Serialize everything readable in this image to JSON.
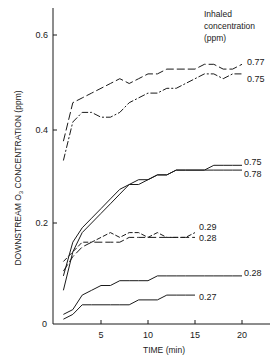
{
  "chart_data": {
    "type": "line",
    "title": "",
    "xlabel": "TIME (min)",
    "ylabel": "DOWNSTREAM O3 CONCENTRATION (ppm)",
    "xlim": [
      0,
      22
    ],
    "ylim": [
      0,
      0.65
    ],
    "x_ticks": [
      5,
      10,
      15,
      20
    ],
    "y_ticks": [
      0,
      0.2,
      0.4,
      0.6
    ],
    "y_tick_labels": [
      "0",
      "0.2",
      "0.4",
      "0.6"
    ],
    "grid": false,
    "legend": {
      "title": "Inhaled concentration (ppm)",
      "position": "top-right",
      "style": "end-of-line labels"
    },
    "series": [
      {
        "name": "0.77",
        "style": "long-dash",
        "x": [
          1,
          2,
          3,
          4,
          5,
          6,
          7,
          8,
          9,
          10,
          11,
          12,
          13,
          14,
          15,
          16,
          17,
          18,
          19,
          20
        ],
        "values": [
          0.38,
          0.46,
          0.47,
          0.48,
          0.49,
          0.5,
          0.51,
          0.5,
          0.51,
          0.52,
          0.52,
          0.53,
          0.53,
          0.53,
          0.53,
          0.54,
          0.54,
          0.53,
          0.53,
          0.54
        ]
      },
      {
        "name": "0.75",
        "style": "dash-dot",
        "x": [
          1,
          2,
          3,
          4,
          5,
          6,
          7,
          8,
          9,
          10,
          11,
          12,
          13,
          14,
          15,
          16,
          17,
          18,
          19,
          20
        ],
        "values": [
          0.34,
          0.42,
          0.44,
          0.44,
          0.43,
          0.43,
          0.44,
          0.46,
          0.47,
          0.48,
          0.48,
          0.49,
          0.49,
          0.5,
          0.51,
          0.52,
          0.52,
          0.51,
          0.52,
          0.52
        ]
      },
      {
        "name": "0.75",
        "style": "solid",
        "x": [
          1,
          2,
          3,
          4,
          5,
          6,
          7,
          8,
          9,
          10,
          11,
          12,
          13,
          14,
          15,
          16,
          17,
          18,
          19,
          20
        ],
        "values": [
          0.1,
          0.17,
          0.2,
          0.22,
          0.24,
          0.26,
          0.28,
          0.29,
          0.3,
          0.3,
          0.31,
          0.31,
          0.32,
          0.32,
          0.32,
          0.32,
          0.33,
          0.33,
          0.33,
          0.33
        ]
      },
      {
        "name": "0.78",
        "style": "solid",
        "x": [
          1,
          2,
          3,
          4,
          5,
          6,
          7,
          8,
          9,
          10,
          11,
          12,
          13,
          14,
          15,
          16,
          17,
          18,
          19,
          20
        ],
        "values": [
          0.07,
          0.15,
          0.19,
          0.21,
          0.23,
          0.25,
          0.27,
          0.29,
          0.29,
          0.3,
          0.31,
          0.31,
          0.32,
          0.32,
          0.32,
          0.32,
          0.32,
          0.32,
          0.32,
          0.32
        ]
      },
      {
        "name": "0.29",
        "style": "dashed",
        "x": [
          1,
          2,
          3,
          4,
          5,
          6,
          7,
          8,
          9,
          10,
          11,
          12,
          13,
          14,
          15
        ],
        "values": [
          0.13,
          0.15,
          0.17,
          0.17,
          0.18,
          0.19,
          0.18,
          0.19,
          0.19,
          0.18,
          0.19,
          0.18,
          0.18,
          0.18,
          0.19
        ]
      },
      {
        "name": "0.28",
        "style": "long-dash",
        "x": [
          1,
          2,
          3,
          4,
          5,
          6,
          7,
          8,
          9,
          10,
          11,
          12,
          13,
          14,
          15
        ],
        "values": [
          0.11,
          0.14,
          0.16,
          0.17,
          0.17,
          0.17,
          0.17,
          0.18,
          0.18,
          0.18,
          0.18,
          0.18,
          0.18,
          0.18,
          0.18
        ]
      },
      {
        "name": "0.28",
        "style": "solid",
        "x": [
          1,
          2,
          3,
          4,
          5,
          6,
          7,
          8,
          9,
          10,
          11,
          12,
          13,
          14,
          15,
          16,
          17,
          18,
          19,
          20
        ],
        "values": [
          0.02,
          0.03,
          0.06,
          0.07,
          0.08,
          0.08,
          0.09,
          0.09,
          0.09,
          0.09,
          0.1,
          0.1,
          0.1,
          0.1,
          0.1,
          0.1,
          0.1,
          0.1,
          0.1,
          0.1
        ]
      },
      {
        "name": "0.27",
        "style": "solid",
        "x": [
          1,
          2,
          3,
          4,
          5,
          6,
          7,
          8,
          9,
          10,
          11,
          12,
          13,
          14,
          15
        ],
        "values": [
          0.01,
          0.02,
          0.04,
          0.04,
          0.04,
          0.04,
          0.04,
          0.04,
          0.05,
          0.05,
          0.05,
          0.06,
          0.06,
          0.06,
          0.06
        ]
      }
    ]
  },
  "labels": {
    "legend_title_line1": "Inhaled",
    "legend_title_line2": "concentration",
    "legend_title_line3": "(ppm)",
    "ylabel_main": "DOWNSTREAM O",
    "ylabel_sub": "3",
    "ylabel_tail": " CONCENTRATION (ppm)",
    "xlabel": "TIME (min)",
    "y_ticks": [
      "0",
      "0.2",
      "0.4",
      "0.6"
    ],
    "x_ticks": [
      "5",
      "10",
      "15",
      "20"
    ],
    "end_labels": [
      "0.77",
      "0.75",
      "0.75",
      "0.78",
      "0.29",
      "0.28",
      "0.28",
      "0.27"
    ]
  }
}
